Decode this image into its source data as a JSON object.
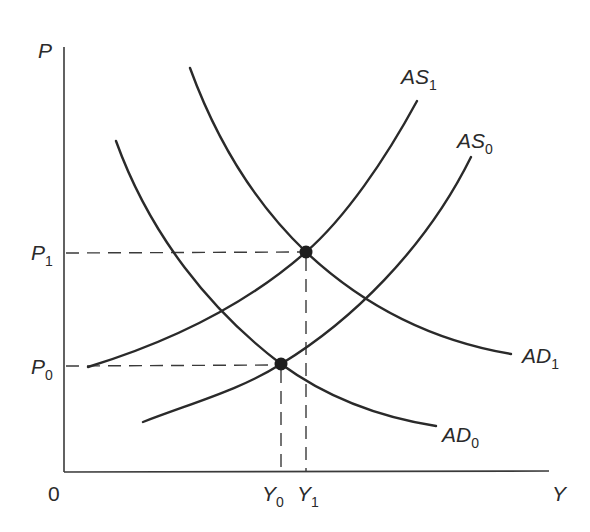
{
  "diagram": {
    "title": "",
    "axes": {
      "y_label": "P",
      "x_label": "Y",
      "origin_label": "0"
    },
    "price_levels": [
      {
        "label": "P",
        "subscript": "1"
      },
      {
        "label": "P",
        "subscript": "0"
      }
    ],
    "output_levels": [
      {
        "label": "Y",
        "subscript": "0"
      },
      {
        "label": "Y",
        "subscript": "1"
      }
    ],
    "curves": [
      {
        "name": "AS",
        "subscript": "1",
        "type": "aggregate-supply"
      },
      {
        "name": "AS",
        "subscript": "0",
        "type": "aggregate-supply"
      },
      {
        "name": "AD",
        "subscript": "1",
        "type": "aggregate-demand"
      },
      {
        "name": "AD",
        "subscript": "0",
        "type": "aggregate-demand"
      }
    ],
    "equilibria": [
      {
        "id": "E0",
        "curves": [
          "AS0",
          "AD0"
        ],
        "price": "P0",
        "output": "Y0"
      },
      {
        "id": "E1",
        "curves": [
          "AS1",
          "AD1"
        ],
        "price": "P1",
        "output": "Y1"
      }
    ],
    "colors": {
      "line": "#2a2a2a",
      "background": "#ffffff"
    }
  }
}
